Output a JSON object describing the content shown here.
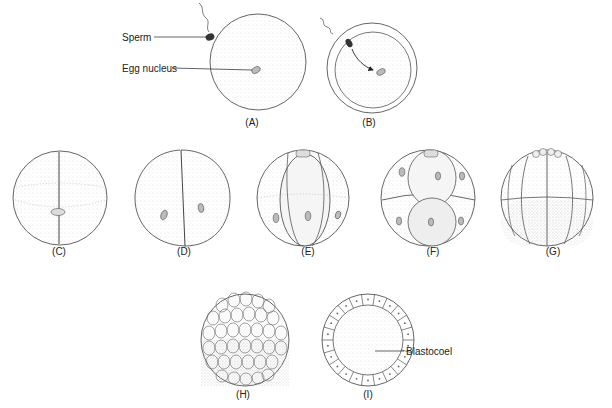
{
  "figure": {
    "panels": [
      {
        "id": "A",
        "label": "(A)",
        "stage": "egg with sperm at surface"
      },
      {
        "id": "B",
        "label": "(B)",
        "stage": "sperm nucleus migrating to egg nucleus"
      },
      {
        "id": "C",
        "label": "(C)",
        "stage": "first cleavage"
      },
      {
        "id": "D",
        "label": "(D)",
        "stage": "2-cell stage"
      },
      {
        "id": "E",
        "label": "(E)",
        "stage": "4-cell stage"
      },
      {
        "id": "F",
        "label": "(F)",
        "stage": "8-cell stage"
      },
      {
        "id": "G",
        "label": "(G)",
        "stage": "16-cell stage"
      },
      {
        "id": "H",
        "label": "(H)",
        "stage": "morula"
      },
      {
        "id": "I",
        "label": "(I)",
        "stage": "blastula cross-section"
      }
    ],
    "annotations": {
      "sperm": "Sperm",
      "egg_nucleus": "Egg nucleus",
      "blastocoel": "Blastocoel"
    },
    "colors": {
      "outline": "#555555",
      "stipple": "#bdbdbd",
      "nucleus": "#9a9a9a",
      "sperm": "#333333"
    }
  }
}
